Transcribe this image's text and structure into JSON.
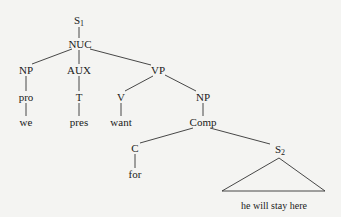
{
  "diagram": {
    "type": "syntax-tree",
    "nodes": {
      "s1": {
        "label": "S",
        "sub": "1"
      },
      "nuc": {
        "label": "NUC"
      },
      "np1": {
        "label": "NP"
      },
      "aux": {
        "label": "AUX"
      },
      "vp": {
        "label": "VP"
      },
      "pro": {
        "label": "pro"
      },
      "t": {
        "label": "T"
      },
      "v": {
        "label": "V"
      },
      "we": {
        "label": "we"
      },
      "pres": {
        "label": "pres"
      },
      "want": {
        "label": "want"
      },
      "np2": {
        "label": "NP"
      },
      "comp": {
        "label": "Comp"
      },
      "c": {
        "label": "C"
      },
      "for": {
        "label": "for"
      },
      "s2": {
        "label": "S",
        "sub": "2"
      },
      "s2_text": {
        "label": "he will stay here"
      }
    },
    "edges": [
      [
        "s1",
        "nuc"
      ],
      [
        "nuc",
        "np1"
      ],
      [
        "nuc",
        "aux"
      ],
      [
        "nuc",
        "vp"
      ],
      [
        "np1",
        "pro"
      ],
      [
        "pro",
        "we"
      ],
      [
        "aux",
        "t"
      ],
      [
        "t",
        "pres"
      ],
      [
        "vp",
        "v"
      ],
      [
        "v",
        "want"
      ],
      [
        "vp",
        "np2"
      ],
      [
        "np2",
        "comp"
      ],
      [
        "comp",
        "c"
      ],
      [
        "c",
        "for"
      ],
      [
        "comp",
        "s2"
      ],
      [
        "s2",
        "triangle:s2_text"
      ]
    ],
    "line_color": "#333333"
  }
}
